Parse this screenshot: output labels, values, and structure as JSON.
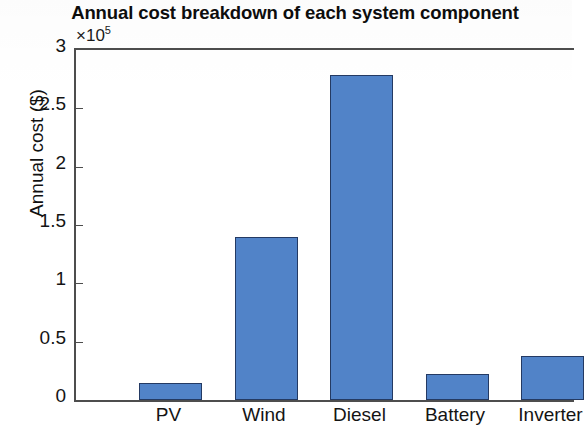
{
  "chart_data": {
    "type": "bar",
    "title": "Annual cost breakdown of each system component",
    "xlabel": "",
    "ylabel": "Annual cost ($)",
    "categories": [
      "PV",
      "Wind",
      "Diesel",
      "Battery",
      "Inverter"
    ],
    "values": [
      0.15,
      1.4,
      2.79,
      0.22,
      0.38
    ],
    "value_scale_note": "values are in units of 1e5 dollars",
    "exponent_text": "×10",
    "exponent_power": "5",
    "ylim": [
      0,
      3
    ],
    "yticks": [
      "0",
      "0.5",
      "1",
      "1.5",
      "2",
      "2.5",
      "3"
    ],
    "ytick_values": [
      0,
      0.5,
      1,
      1.5,
      2,
      2.5,
      3
    ],
    "grid": false,
    "legend": false,
    "bar_color": "#5183c8",
    "bar_edge_color": "#243a63",
    "axis_color": "#4d4d4d",
    "background_color": "#ffffff"
  }
}
